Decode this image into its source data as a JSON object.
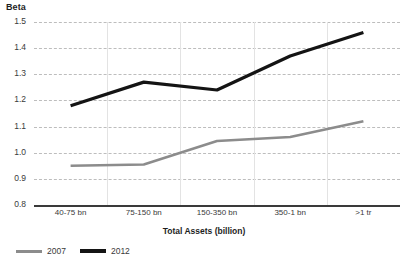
{
  "chart_data": {
    "type": "line",
    "title": "",
    "subtitle": "",
    "xlabel": "Total Assets (billion)",
    "ylabel": "Beta",
    "categories": [
      "40-75 bn",
      "75-150 bn",
      "150-350 bn",
      "350-1 bn",
      ">1 tr"
    ],
    "series": [
      {
        "name": "2007",
        "color": "#8c8c8c",
        "values": [
          0.95,
          0.955,
          1.045,
          1.06,
          1.12
        ]
      },
      {
        "name": "2012",
        "color": "#141414",
        "values": [
          1.18,
          1.27,
          1.24,
          1.37,
          1.46
        ]
      }
    ],
    "ylim": [
      0.8,
      1.5
    ],
    "ytick_labels": [
      "1.5",
      "1.4",
      "1.3",
      "1.2",
      "1.1",
      "1.0",
      "0.9",
      "0.8"
    ],
    "ytick_values": [
      1.5,
      1.4,
      1.3,
      1.2,
      1.1,
      1.0,
      0.9,
      0.8
    ],
    "grid": "horizontal-dashed-and-vertical-category-separators",
    "legend_position": "bottom-left"
  },
  "legend": {
    "items": [
      {
        "label": "2007",
        "color": "#8c8c8c"
      },
      {
        "label": "2012",
        "color": "#141414"
      }
    ]
  }
}
